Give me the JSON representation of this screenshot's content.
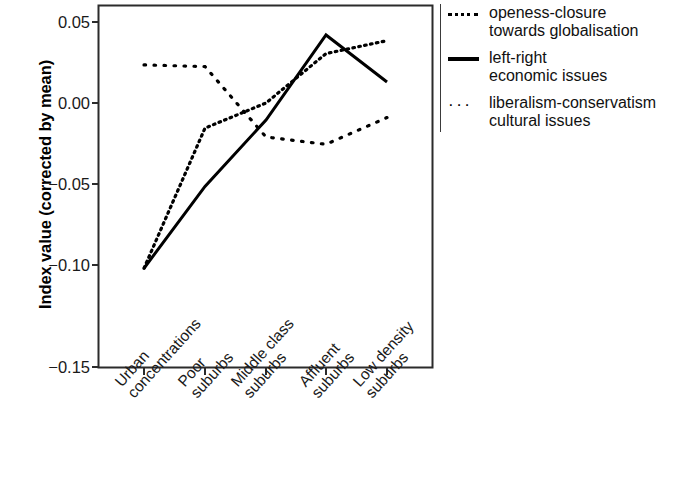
{
  "chart_data": {
    "type": "line",
    "title": "",
    "xlabel": "",
    "ylabel": "Index value (corrected by mean)",
    "categories": [
      "Urban concentrations",
      "Poor suburbs",
      "Middle class suburbs",
      "Affluent suburbs",
      "Low density suburbs"
    ],
    "ylim": [
      -0.15,
      0.06
    ],
    "yticks": [
      "0.05",
      "0.00",
      "−0.05",
      "−0.10",
      "−0.15"
    ],
    "ytick_values": [
      0.05,
      0.0,
      -0.05,
      -0.1,
      -0.15
    ],
    "grid": false,
    "legend_position": "right",
    "series": [
      {
        "name": "openess-closure towards globalisation",
        "style": "dotted",
        "values": [
          -0.102,
          -0.0155,
          0.0,
          0.0305,
          0.0385
        ]
      },
      {
        "name": "left-right economic issues",
        "style": "solid",
        "values": [
          -0.102,
          -0.0515,
          -0.0105,
          0.042,
          0.013
        ]
      },
      {
        "name": "liberalism-conservatism cultural issues",
        "style": "dotted-sparse",
        "values": [
          0.0235,
          0.0225,
          -0.021,
          -0.0255,
          -0.009
        ]
      }
    ]
  },
  "axes": {
    "y_label": "Index value (corrected by mean)",
    "y_ticks": [
      {
        "label": "0.05",
        "value": 0.05
      },
      {
        "label": "0.00",
        "value": 0.0
      },
      {
        "label": "−0.05",
        "value": -0.05
      },
      {
        "label": "−0.10",
        "value": -0.1
      },
      {
        "label": "−0.15",
        "value": -0.15
      }
    ],
    "x_ticks": [
      {
        "line1": "Urban",
        "line2": "concentrations"
      },
      {
        "line1": "Poor",
        "line2": "suburbs"
      },
      {
        "line1": "Middle class",
        "line2": "suburbs"
      },
      {
        "line1": "Affluent",
        "line2": "suburbs"
      },
      {
        "line1": "Low density",
        "line2": "suburbs"
      }
    ]
  },
  "legend": {
    "items": [
      {
        "key": "dotted-fine",
        "line1": "openess-closure",
        "line2": "towards globalisation"
      },
      {
        "key": "solid",
        "line1": "left-right",
        "line2": "economic issues"
      },
      {
        "key": "dotted-wide",
        "line1": "liberalism-conservatism",
        "line2": "cultural issues"
      }
    ]
  },
  "colors": {
    "line": "#000000",
    "axis": "#2b2b2b",
    "background": "#ffffff"
  }
}
